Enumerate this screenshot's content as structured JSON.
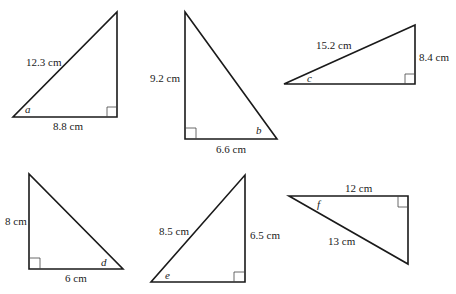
{
  "triangles": [
    {
      "id": "a",
      "angle_label": "a",
      "sides": [
        {
          "label": "12.3 cm",
          "role": "hypotenuse"
        },
        {
          "label": "8.8 cm",
          "role": "adjacent"
        }
      ],
      "vertices": [
        [
          13,
          117
        ],
        [
          117,
          117
        ],
        [
          117,
          12
        ]
      ],
      "right_angle_at": [
        117,
        117
      ]
    },
    {
      "id": "b",
      "angle_label": "b",
      "sides": [
        {
          "label": "9.2 cm",
          "role": "opposite"
        },
        {
          "label": "6.6 cm",
          "role": "adjacent"
        }
      ],
      "vertices": [
        [
          185,
          12
        ],
        [
          185,
          139
        ],
        [
          277,
          139
        ]
      ],
      "right_angle_at": [
        185,
        139
      ]
    },
    {
      "id": "c",
      "angle_label": "c",
      "sides": [
        {
          "label": "15.2 cm",
          "role": "hypotenuse"
        },
        {
          "label": "8.4 cm",
          "role": "opposite"
        }
      ],
      "vertices": [
        [
          284,
          84
        ],
        [
          415,
          84
        ],
        [
          415,
          25
        ]
      ],
      "right_angle_at": [
        415,
        84
      ]
    },
    {
      "id": "d",
      "angle_label": "d",
      "sides": [
        {
          "label": "8 cm",
          "role": "opposite"
        },
        {
          "label": "6 cm",
          "role": "adjacent"
        }
      ],
      "vertices": [
        [
          29,
          174
        ],
        [
          29,
          269
        ],
        [
          123,
          269
        ]
      ],
      "right_angle_at": [
        29,
        269
      ]
    },
    {
      "id": "e",
      "angle_label": "e",
      "sides": [
        {
          "label": "8.5 cm",
          "role": "hypotenuse"
        },
        {
          "label": "6.5 cm",
          "role": "opposite"
        }
      ],
      "vertices": [
        [
          151,
          282
        ],
        [
          245,
          282
        ],
        [
          245,
          175
        ]
      ],
      "right_angle_at": [
        245,
        282
      ]
    },
    {
      "id": "f",
      "angle_label": "f",
      "sides": [
        {
          "label": "12 cm",
          "role": "adjacent"
        },
        {
          "label": "13 cm",
          "role": "hypotenuse"
        }
      ],
      "vertices": [
        [
          289,
          196
        ],
        [
          408,
          196
        ],
        [
          408,
          264
        ]
      ],
      "right_angle_at": [
        408,
        196
      ]
    }
  ]
}
